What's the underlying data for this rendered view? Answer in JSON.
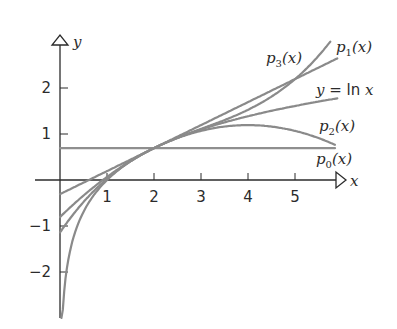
{
  "chart_data": {
    "type": "line",
    "title": "",
    "xlabel": "x",
    "ylabel": "y",
    "xlim": [
      -0.5,
      6.1
    ],
    "ylim": [
      -3.0,
      2.9
    ],
    "grid": false,
    "x_ticks": [
      1,
      2,
      3,
      4,
      5
    ],
    "y_ticks": [
      -2,
      -1,
      1,
      2
    ],
    "x_tick_labels": [
      "1",
      "2",
      "3",
      "4",
      "5"
    ],
    "y_tick_labels": [
      "−2",
      "−1",
      "1",
      "2"
    ],
    "series": [
      {
        "name": "y = ln x",
        "formula": "ln(x)",
        "x_range": [
          0.03,
          5.9
        ],
        "label_text": "y = ln x",
        "sample_points": [
          [
            0.05,
            -3.0
          ],
          [
            1,
            0
          ],
          [
            2,
            0.693
          ],
          [
            3,
            1.099
          ],
          [
            4,
            1.386
          ],
          [
            5,
            1.609
          ],
          [
            5.9,
            1.775
          ]
        ]
      },
      {
        "name": "p0(x)",
        "formula": "ln2",
        "x_range": [
          0,
          5.85
        ],
        "label_text": "p0(x)",
        "sample_points": [
          [
            0,
            0.693
          ],
          [
            5.85,
            0.693
          ]
        ]
      },
      {
        "name": "p1(x)",
        "formula": "ln2 + (x-2)/2",
        "x_range": [
          0,
          5.9
        ],
        "label_text": "p1(x)",
        "sample_points": [
          [
            0,
            -0.307
          ],
          [
            2,
            0.693
          ],
          [
            5.9,
            2.643
          ]
        ]
      },
      {
        "name": "p2(x)",
        "formula": "ln2 + (x-2)/2 - (x-2)^2/8",
        "x_range": [
          0,
          5.85
        ],
        "label_text": "p2(x)",
        "sample_points": [
          [
            0,
            -0.807
          ],
          [
            2,
            0.693
          ],
          [
            4,
            1.193
          ],
          [
            5.85,
            0.791
          ]
        ]
      },
      {
        "name": "p3(x)",
        "formula": "ln2 + (x-2)/2 - (x-2)^2/8 + (x-2)^3/24",
        "x_range": [
          0,
          5.75
        ],
        "label_text": "p3(x)",
        "sample_points": [
          [
            0,
            -1.14
          ],
          [
            2,
            0.693
          ],
          [
            5,
            2.318
          ],
          [
            5.75,
            2.891
          ]
        ]
      }
    ],
    "annotations": [
      {
        "text": "p3(x)",
        "x": 4.55,
        "y": 2.6
      },
      {
        "text": "p1(x)",
        "x": 5.85,
        "y": 2.75
      },
      {
        "text": "y = ln x",
        "x": 5.05,
        "y": 2.05
      },
      {
        "text": "p2(x)",
        "x": 5.95,
        "y": 1.05
      },
      {
        "text": "p0(x)",
        "x": 5.95,
        "y": 0.33
      }
    ]
  },
  "labels": {
    "x_axis": "x",
    "y_axis": "y",
    "lnx_y": "y",
    "lnx_eq": " = ",
    "lnx_ln": "ln",
    "lnx_x": " x",
    "p": "p",
    "arg": "(x)",
    "sub0": "0",
    "sub1": "1",
    "sub2": "2",
    "sub3": "3"
  },
  "colors": {
    "axis": "#2b2b2b",
    "curve": "#8a8a8a",
    "background": "#ffffff"
  }
}
